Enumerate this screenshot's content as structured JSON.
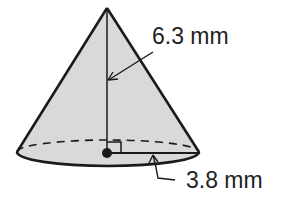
{
  "figure": {
    "type": "cone",
    "labels": {
      "slant_height": "6.3 mm",
      "radius": "3.8 mm"
    },
    "colors": {
      "fill": "#d9d9d9",
      "stroke": "#1a1a1a",
      "text": "#222222"
    }
  }
}
